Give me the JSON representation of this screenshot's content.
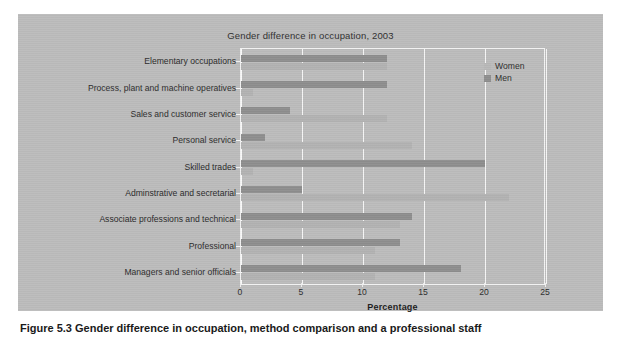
{
  "figure": {
    "caption": "Figure 5.3 Gender difference in occupation, method comparison and a professional staff"
  },
  "legend": {
    "position": "top-right",
    "entries": [
      {
        "label": "Women",
        "color": "#b8b8b8",
        "swatch_name": "legend-swatch-women"
      },
      {
        "label": "Men",
        "color": "#8e8e8e",
        "swatch_name": "legend-swatch-men"
      }
    ]
  },
  "chart_data": {
    "type": "bar",
    "orientation": "horizontal",
    "title": "Gender difference in occupation, 2003",
    "xlabel": "Percentage",
    "ylabel": "",
    "xlim": [
      0,
      25
    ],
    "xticks": [
      0,
      5,
      10,
      15,
      20,
      25
    ],
    "grid": true,
    "legend_position": "top-right",
    "categories": [
      "Managers and senior officials",
      "Professional",
      "Associate professions and technical",
      "Adminstrative and secretarial",
      "Skilled trades",
      "Personal service",
      "Sales and customer service",
      "Process, plant and machine operatives",
      "Elementary occupations"
    ],
    "series": [
      {
        "name": "Men",
        "color": "#8e8e8e",
        "values": [
          18,
          13,
          14,
          5,
          20,
          2,
          4,
          12,
          12
        ]
      },
      {
        "name": "Women",
        "color": "#b2b2b2",
        "values": [
          11,
          11,
          13,
          22,
          1,
          14,
          12,
          1,
          12
        ]
      }
    ]
  }
}
